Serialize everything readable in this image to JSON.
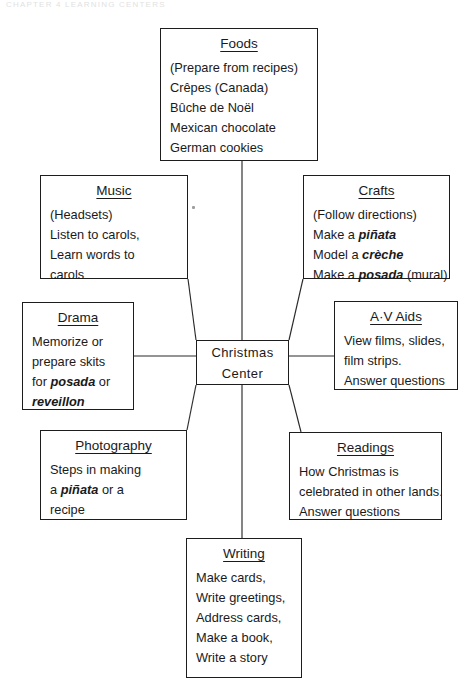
{
  "page": {
    "running_head": "CHAPTER 4   LEARNING CENTERS",
    "background_color": "#ffffff",
    "line_color": "#2a2a2a",
    "border_color": "#1d1d1d"
  },
  "diagram": {
    "type": "web-cluster",
    "center": {
      "id": "christmas-center",
      "line1": "Christmas",
      "line2": "Center"
    },
    "nodes": [
      {
        "id": "foods",
        "title": "Foods",
        "lines": [
          [
            {
              "t": "(Prepare from recipes)",
              "i": false
            }
          ],
          [
            {
              "t": "Crêpes (Canada)",
              "i": false
            }
          ],
          [
            {
              "t": "Bûche de Noël",
              "i": false
            }
          ],
          [
            {
              "t": "Mexican chocolate",
              "i": false
            }
          ],
          [
            {
              "t": "German cookies",
              "i": false
            }
          ]
        ]
      },
      {
        "id": "music",
        "title": "Music",
        "lines": [
          [
            {
              "t": "(Headsets)",
              "i": false
            }
          ],
          [
            {
              "t": "Listen to carols,",
              "i": false
            }
          ],
          [
            {
              "t": "Learn words to",
              "i": false
            }
          ],
          [
            {
              "t": "carols",
              "i": false
            }
          ]
        ]
      },
      {
        "id": "crafts",
        "title": "Crafts",
        "lines": [
          [
            {
              "t": "(Follow directions)",
              "i": false
            }
          ],
          [
            {
              "t": "Make a ",
              "i": false
            },
            {
              "t": "piñata",
              "i": true
            }
          ],
          [
            {
              "t": "Model a ",
              "i": false
            },
            {
              "t": "crèche",
              "i": true
            }
          ],
          [
            {
              "t": "Make a ",
              "i": false
            },
            {
              "t": "posada",
              "i": true
            },
            {
              "t": " (mural)",
              "i": false
            }
          ]
        ]
      },
      {
        "id": "drama",
        "title": "Drama",
        "lines": [
          [
            {
              "t": "Memorize or",
              "i": false
            }
          ],
          [
            {
              "t": "prepare skits",
              "i": false
            }
          ],
          [
            {
              "t": "for ",
              "i": false
            },
            {
              "t": "posada",
              "i": true
            },
            {
              "t": " or",
              "i": false
            }
          ],
          [
            {
              "t": "reveillon",
              "i": true
            }
          ]
        ]
      },
      {
        "id": "av-aids",
        "title": "A·V Aids",
        "lines": [
          [
            {
              "t": "View films, slides,",
              "i": false
            }
          ],
          [
            {
              "t": "film strips.",
              "i": false
            }
          ],
          [
            {
              "t": "Answer questions",
              "i": false
            }
          ]
        ]
      },
      {
        "id": "photography",
        "title": "Photography",
        "lines": [
          [
            {
              "t": "Steps in making",
              "i": false
            }
          ],
          [
            {
              "t": "a ",
              "i": false
            },
            {
              "t": "piñata",
              "i": true
            },
            {
              "t": " or a",
              "i": false
            }
          ],
          [
            {
              "t": "recipe",
              "i": false
            }
          ]
        ]
      },
      {
        "id": "readings",
        "title": "Readings",
        "lines": [
          [
            {
              "t": "How Christmas is",
              "i": false
            }
          ],
          [
            {
              "t": "celebrated in other lands.",
              "i": false
            }
          ],
          [
            {
              "t": "Answer questions",
              "i": false
            }
          ]
        ]
      },
      {
        "id": "writing",
        "title": "Writing",
        "lines": [
          [
            {
              "t": "Make cards,",
              "i": false
            }
          ],
          [
            {
              "t": "Write greetings,",
              "i": false
            }
          ],
          [
            {
              "t": "Address cards,",
              "i": false
            }
          ],
          [
            {
              "t": "Make a book,",
              "i": false
            }
          ],
          [
            {
              "t": "Write a story",
              "i": false
            }
          ]
        ]
      }
    ],
    "connections": [
      {
        "from": "christmas-center",
        "to": "foods"
      },
      {
        "from": "christmas-center",
        "to": "music"
      },
      {
        "from": "christmas-center",
        "to": "crafts"
      },
      {
        "from": "christmas-center",
        "to": "drama"
      },
      {
        "from": "christmas-center",
        "to": "av-aids"
      },
      {
        "from": "christmas-center",
        "to": "photography"
      },
      {
        "from": "christmas-center",
        "to": "readings"
      },
      {
        "from": "christmas-center",
        "to": "writing"
      }
    ]
  }
}
